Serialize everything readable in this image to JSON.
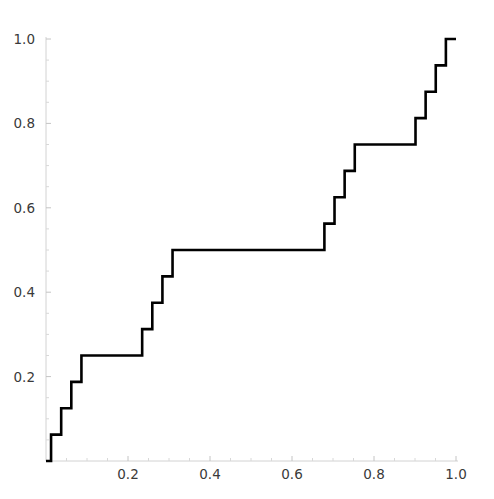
{
  "chart_data": {
    "type": "line",
    "title": "",
    "subtitle": "",
    "xlabel": "",
    "ylabel": "",
    "xlim": [
      0.0,
      1.0
    ],
    "ylim": [
      0.0,
      1.0
    ],
    "grid": false,
    "legend": null,
    "function_name": "Cantor function (Devil's Staircase)",
    "iteration_depth": 4,
    "x_ticks": [
      0.2,
      0.4,
      0.6,
      0.8,
      1.0
    ],
    "x_tick_labels": [
      "0.2",
      "0.4",
      "0.6",
      "0.8",
      "1.0"
    ],
    "y_ticks": [
      0.2,
      0.4,
      0.6,
      0.8,
      1.0
    ],
    "y_tick_labels": [
      "0.2",
      "0.4",
      "0.6",
      "0.8",
      "1.0"
    ],
    "x_minor_ticks": [
      0.05,
      0.1,
      0.15,
      0.25,
      0.3,
      0.35,
      0.45,
      0.5,
      0.55,
      0.65,
      0.7,
      0.75,
      0.85,
      0.9,
      0.95
    ],
    "y_minor_ticks": [
      0.05,
      0.1,
      0.15,
      0.25,
      0.3,
      0.35,
      0.45,
      0.5,
      0.55,
      0.65,
      0.7,
      0.75,
      0.85,
      0.9,
      0.95
    ],
    "series": [
      {
        "name": "cantor",
        "color": "#000000",
        "line_width": 2.6,
        "x": [
          0.0,
          0.012345679,
          0.012345679,
          0.024691358,
          0.024691358,
          0.037037037,
          0.037037037,
          0.049382716,
          0.049382716,
          0.061728395,
          0.061728395,
          0.074074074,
          0.074074074,
          0.086419753,
          0.086419753,
          0.098765432,
          0.098765432,
          0.111111111,
          0.111111111,
          0.222222222,
          0.222222222,
          0.234567901,
          0.234567901,
          0.24691358,
          0.24691358,
          0.259259259,
          0.259259259,
          0.271604938,
          0.271604938,
          0.283950617,
          0.283950617,
          0.296296296,
          0.296296296,
          0.308641975,
          0.308641975,
          0.320987654,
          0.320987654,
          0.333333333,
          0.333333333,
          0.666666667,
          0.666666667,
          0.679012346,
          0.679012346,
          0.691358025,
          0.691358025,
          0.703703704,
          0.703703704,
          0.716049383,
          0.716049383,
          0.728395062,
          0.728395062,
          0.740740741,
          0.740740741,
          0.75308642,
          0.75308642,
          0.765432099,
          0.765432099,
          0.777777778,
          0.777777778,
          0.888888889,
          0.888888889,
          0.901234568,
          0.901234568,
          0.913580247,
          0.913580247,
          0.925925926,
          0.925925926,
          0.938271605,
          0.938271605,
          0.950617284,
          0.950617284,
          0.962962963,
          0.962962963,
          0.975308642,
          0.975308642,
          0.987654321,
          0.987654321,
          1.0
        ],
        "y": [
          0.0,
          0.0,
          0.0625,
          0.0625,
          0.0625,
          0.0625,
          0.125,
          0.125,
          0.125,
          0.125,
          0.1875,
          0.1875,
          0.1875,
          0.1875,
          0.25,
          0.25,
          0.25,
          0.25,
          0.25,
          0.25,
          0.25,
          0.25,
          0.3125,
          0.3125,
          0.3125,
          0.3125,
          0.375,
          0.375,
          0.375,
          0.375,
          0.4375,
          0.4375,
          0.4375,
          0.4375,
          0.5,
          0.5,
          0.5,
          0.5,
          0.5,
          0.5,
          0.5,
          0.5,
          0.5625,
          0.5625,
          0.5625,
          0.5625,
          0.625,
          0.625,
          0.625,
          0.625,
          0.6875,
          0.6875,
          0.6875,
          0.6875,
          0.75,
          0.75,
          0.75,
          0.75,
          0.75,
          0.75,
          0.75,
          0.75,
          0.8125,
          0.8125,
          0.8125,
          0.8125,
          0.875,
          0.875,
          0.875,
          0.875,
          0.9375,
          0.9375,
          0.9375,
          0.9375,
          1.0,
          1.0,
          1.0,
          1.0
        ],
        "plateaus": [
          {
            "x_start": 0.111111111,
            "x_end": 0.222222222,
            "y": 0.25
          },
          {
            "x_start": 0.333333333,
            "x_end": 0.666666667,
            "y": 0.5
          },
          {
            "x_start": 0.777777778,
            "x_end": 0.888888889,
            "y": 0.75
          }
        ]
      }
    ],
    "axis_color": "#d2d2d2",
    "background_color": "#ffffff",
    "label_color": "#3a3a3a"
  },
  "plot": {
    "origin_px": {
      "x": 46,
      "y": 461
    },
    "end_px": {
      "x": 456,
      "y": 39
    }
  }
}
